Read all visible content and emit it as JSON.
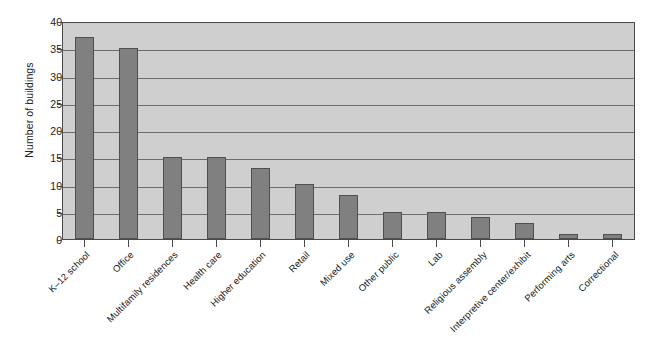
{
  "chart_data": {
    "type": "bar",
    "title": "",
    "xlabel": "",
    "ylabel": "Number of buildings",
    "ylim": [
      0,
      40
    ],
    "ytick_step": 5,
    "yticks": [
      0,
      5,
      10,
      15,
      20,
      25,
      30,
      35,
      40
    ],
    "grid": true,
    "legend": "none",
    "orientation": "vertical",
    "bar_color": "#808080",
    "plot_background": "#cfcfcf",
    "axis_color": "#4a4a4a",
    "gridline_color": "#6d6d6d",
    "categories": [
      "K–12 school",
      "Office",
      "Multifamily residences",
      "Health care",
      "Higher education",
      "Retail",
      "Mixed use",
      "Other public",
      "Lab",
      "Religious assembly",
      "Interpretive center/exhibit",
      "Performing arts",
      "Correctional"
    ],
    "values": [
      37,
      35,
      15,
      15,
      13,
      10,
      8,
      5,
      5,
      4,
      3,
      1,
      1
    ]
  }
}
